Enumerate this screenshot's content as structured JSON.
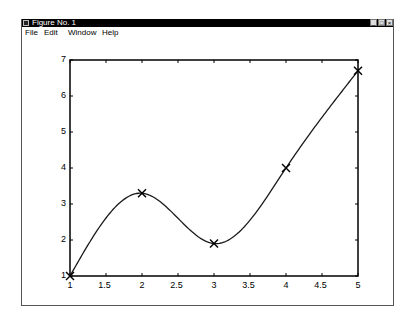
{
  "window": {
    "title": "Figure No. 1",
    "buttons": {
      "minimize": "_",
      "maximize": "□",
      "close": "×"
    }
  },
  "menu": {
    "items": [
      {
        "label": "File"
      },
      {
        "label": "Edit"
      },
      {
        "label": "Window"
      },
      {
        "label": "Help"
      }
    ]
  },
  "colors": {
    "line": "#1a1a1a",
    "axes": "#000000",
    "background": "#ffffff",
    "titlebar": "#000000"
  },
  "chart_data": {
    "type": "line",
    "title": "",
    "xlabel": "",
    "ylabel": "",
    "xlim": [
      1,
      5
    ],
    "ylim": [
      1,
      7
    ],
    "grid": false,
    "legend": null,
    "x_ticks": [
      "1",
      "1.5",
      "2",
      "2.5",
      "3",
      "3.5",
      "4",
      "4.5",
      "5"
    ],
    "y_ticks": [
      "1",
      "2",
      "3",
      "4",
      "5",
      "6",
      "7"
    ],
    "series": [
      {
        "name": "data points",
        "style": "markers x",
        "x": [
          1,
          2,
          3,
          4,
          5
        ],
        "y": [
          1.0,
          3.3,
          1.9,
          4.0,
          6.7
        ]
      },
      {
        "name": "spline interpolation",
        "style": "solid line",
        "x": [
          1,
          1.25,
          1.5,
          1.75,
          2,
          2.25,
          2.5,
          2.75,
          3,
          3.25,
          3.5,
          3.75,
          4,
          4.25,
          4.5,
          4.75,
          5
        ],
        "y": [
          1.0,
          2.5,
          3.2,
          3.45,
          3.3,
          2.85,
          2.3,
          1.95,
          1.9,
          2.2,
          2.75,
          3.35,
          4.0,
          4.7,
          5.45,
          6.1,
          6.7
        ]
      }
    ]
  }
}
